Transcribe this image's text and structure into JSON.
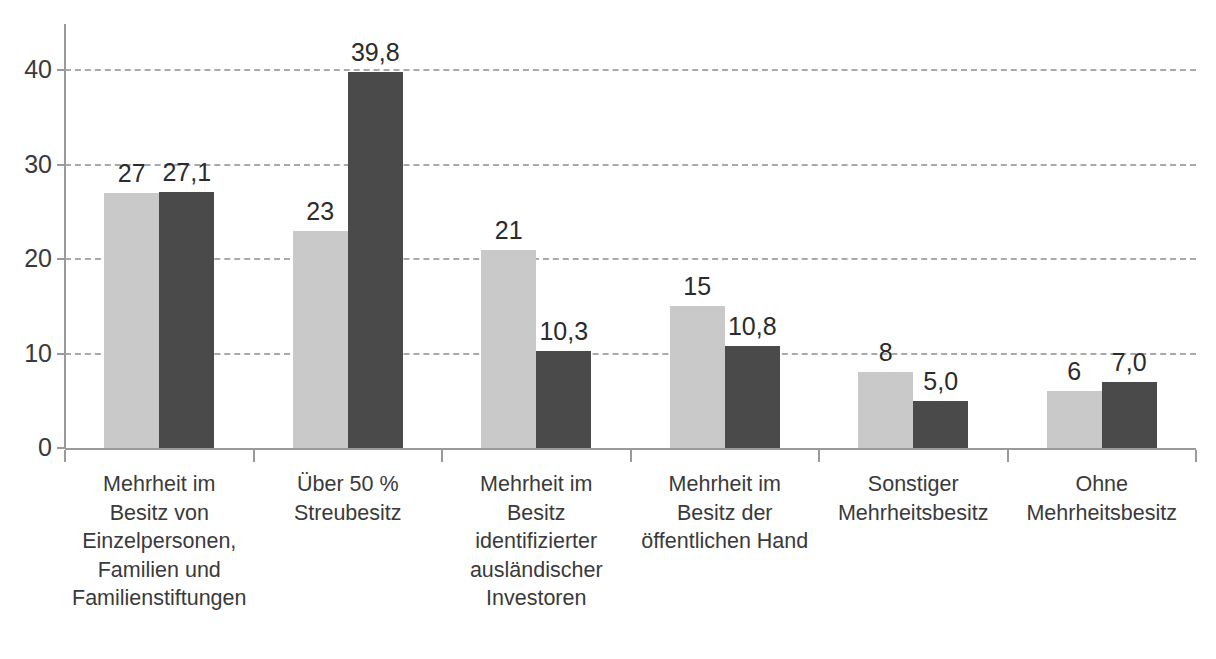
{
  "chart_data": {
    "type": "bar",
    "title": "",
    "subtitle": "",
    "xlabel": "",
    "ylabel": "",
    "ylim": [
      0,
      42
    ],
    "yticks": [
      0,
      10,
      20,
      30,
      40
    ],
    "ytick_labels": [
      "0",
      "10",
      "20",
      "30",
      "40"
    ],
    "grid": true,
    "grid_axis": "y",
    "grid_style": "dashed",
    "legend_position": "none",
    "categories": [
      "Mehrheit im Besitz von Einzelpersonen, Familien und Familienstiftungen",
      "Über 50 % Streubesitz",
      "Mehrheit im Besitz identifizierter ausländischer Investoren",
      "Mehrheit im Besitz der öffentlichen Hand",
      "Sonstiger Mehrheitsbesitz",
      "Ohne Mehrheitsbesitz"
    ],
    "category_lines": [
      [
        "Mehrheit im",
        "Besitz von",
        "Einzelpersonen,",
        "Familien und",
        "Familienstiftungen"
      ],
      [
        "Über 50 %",
        "Streubesitz"
      ],
      [
        "Mehrheit im",
        "Besitz",
        "identifizierter",
        "ausländischer",
        "Investoren"
      ],
      [
        "Mehrheit im",
        "Besitz der",
        "öffentlichen Hand"
      ],
      [
        "Sonstiger",
        "Mehrheitsbesitz"
      ],
      [
        "Ohne",
        "Mehrheitsbesitz"
      ]
    ],
    "series": [
      {
        "name": "Reihe 1",
        "color": "#c9c9c9",
        "values": [
          27,
          23,
          21,
          15,
          8,
          6
        ],
        "labels": [
          "27",
          "23",
          "21",
          "15",
          "8",
          "6"
        ]
      },
      {
        "name": "Reihe 2",
        "color": "#4a4a4a",
        "values": [
          27.1,
          39.8,
          10.3,
          10.8,
          5.0,
          7.0
        ],
        "labels": [
          "27,1",
          "39,8",
          "10,3",
          "10,8",
          "5,0",
          "7,0"
        ]
      }
    ]
  },
  "colors": {
    "series_light": "#c9c9c9",
    "series_dark": "#4a4a4a",
    "gridline": "#a9a9a9",
    "axis": "#9a9a9a",
    "text": "#3a3a3a",
    "background": "#ffffff"
  }
}
